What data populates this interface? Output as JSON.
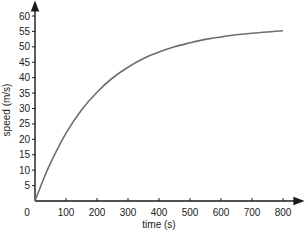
{
  "chart_data": {
    "type": "line",
    "title": "",
    "xlabel": "time (s)",
    "ylabel": "speed (m/s)",
    "xlim": [
      0,
      800
    ],
    "ylim": [
      0,
      60
    ],
    "grid": false,
    "legend": null,
    "x_ticks": [
      0,
      100,
      200,
      300,
      400,
      500,
      600,
      700,
      800
    ],
    "y_ticks": [
      5,
      10,
      15,
      20,
      25,
      30,
      35,
      40,
      45,
      50,
      55,
      60
    ],
    "origin_label": "0",
    "series": [
      {
        "name": "speed",
        "color": "#6e6e6e",
        "x": [
          0,
          25,
          50,
          100,
          150,
          200,
          250,
          300,
          350,
          400,
          450,
          500,
          550,
          600,
          650,
          700,
          750,
          800
        ],
        "values": [
          0,
          6.5,
          12.3,
          22.0,
          29.5,
          35.3,
          39.9,
          43.4,
          46.2,
          48.3,
          50.0,
          51.3,
          52.4,
          53.2,
          53.9,
          54.4,
          54.8,
          55.2
        ]
      }
    ]
  }
}
